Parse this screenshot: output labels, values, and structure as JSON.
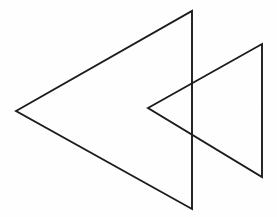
{
  "figure": {
    "background_color": "#fefefe",
    "stroke_color": "#1c1c1c",
    "stroke_width": 1.9,
    "fill": "none",
    "canvas": {
      "width": 277,
      "height": 217
    }
  },
  "shapes": [
    {
      "name": "large-triangle",
      "type": "triangle",
      "orientation": "points-left",
      "points": "16,111 192,11 192,209",
      "vertices": [
        {
          "label": "left-apex",
          "x": 16,
          "y": 111
        },
        {
          "label": "top-right",
          "x": 192,
          "y": 11
        },
        {
          "label": "bottom-right",
          "x": 192,
          "y": 209
        }
      ]
    },
    {
      "name": "small-triangle",
      "type": "triangle",
      "orientation": "points-left",
      "points": "148,108 262,44 262,177",
      "vertices": [
        {
          "label": "left-apex",
          "x": 148,
          "y": 108
        },
        {
          "label": "top-right",
          "x": 262,
          "y": 44
        },
        {
          "label": "bottom-right",
          "x": 262,
          "y": 177
        }
      ]
    }
  ],
  "intersections": [
    {
      "name": "upper-crossing",
      "x": 192,
      "y": 83
    },
    {
      "name": "lower-crossing",
      "x": 192,
      "y": 134
    }
  ],
  "chart_data": {
    "type": "scatter",
    "xlabel": "",
    "ylabel": "",
    "xlim": [
      0,
      277
    ],
    "ylim": [
      217,
      0
    ],
    "grid": false,
    "legend": "none",
    "series": [
      {
        "name": "large-triangle",
        "x": [
          16,
          192,
          192,
          16
        ],
        "y": [
          111,
          11,
          209,
          111
        ]
      },
      {
        "name": "small-triangle",
        "x": [
          148,
          262,
          262,
          148
        ],
        "y": [
          108,
          44,
          177,
          108
        ]
      }
    ]
  }
}
